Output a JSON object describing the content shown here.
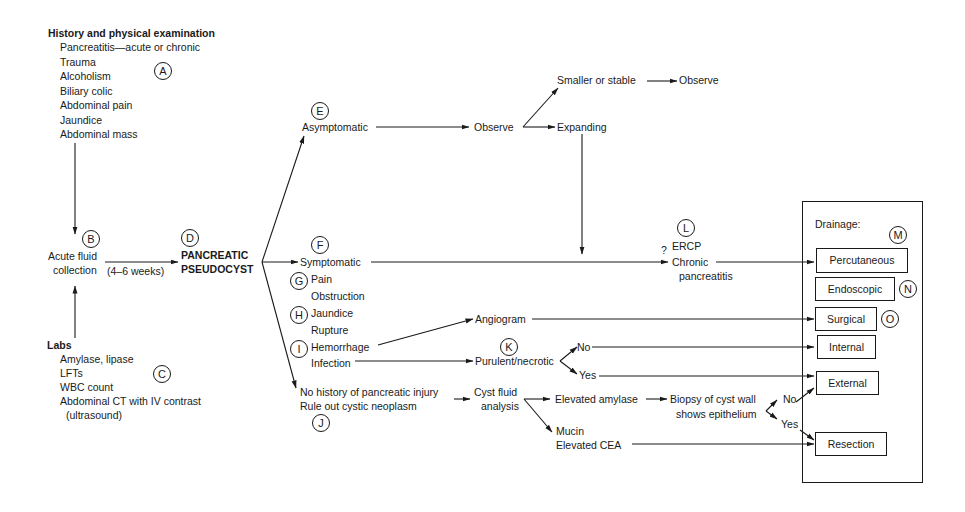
{
  "history": {
    "title": "History and physical examination",
    "items": [
      "Pancreatitis—acute or chronic",
      "Trauma",
      "Alcoholism",
      "Biliary colic",
      "Abdominal pain",
      "Jaundice",
      "Abdominal mass"
    ],
    "marker": "A"
  },
  "acute": {
    "line1": "Acute fluid",
    "line2": "collection",
    "marker": "B",
    "duration": "(4–6 weeks)"
  },
  "labs": {
    "title": "Labs",
    "items": [
      "Amylase, lipase",
      "LFTs",
      "WBC count",
      "Abdominal CT with IV contrast",
      "(ultrasound)"
    ],
    "marker": "C"
  },
  "pseudocyst": {
    "line1": "PANCREATIC",
    "line2": "PSEUDOCYST",
    "marker": "D"
  },
  "asymptomatic": {
    "label": "Asymptomatic",
    "marker": "E",
    "observe": "Observe",
    "smaller": "Smaller or stable",
    "observe2": "Observe",
    "expanding": "Expanding"
  },
  "symptomatic": {
    "label": "Symptomatic",
    "marker": "F",
    "items": [
      {
        "marker": "G",
        "label": "Pain"
      },
      {
        "marker": "",
        "label": "Obstruction"
      },
      {
        "marker": "H",
        "label": "Jaundice"
      },
      {
        "marker": "",
        "label": "Rupture"
      },
      {
        "marker": "I",
        "label": "Hemorrhage"
      },
      {
        "marker": "",
        "label": "Infection"
      }
    ]
  },
  "hemorrhage_path": {
    "angiogram": "Angiogram"
  },
  "infection_path": {
    "purulent": "Purulent/necrotic",
    "marker": "K",
    "no": "No",
    "yes": "Yes"
  },
  "ercp": {
    "question": "?",
    "line1": "ERCP",
    "line2": "Chronic",
    "line3": "pancreatitis",
    "marker": "L"
  },
  "neoplasm": {
    "line1": "No history of pancreatic injury",
    "line2": "Rule out cystic neoplasm",
    "marker": "J",
    "cyst1": "Cyst fluid",
    "cyst2": "analysis",
    "amylase": "Elevated amylase",
    "biopsy1": "Biopsy of cyst wall",
    "biopsy2": "shows epithelium",
    "no": "No",
    "yes": "Yes",
    "mucin1": "Mucin",
    "mucin2": "Elevated CEA"
  },
  "drainage": {
    "title": "Drainage:",
    "boxes": [
      {
        "label": "Percutaneous",
        "marker": "M"
      },
      {
        "label": "Endoscopic",
        "marker": "N"
      },
      {
        "label": "Surgical",
        "marker": "O"
      },
      {
        "label": "Internal",
        "marker": ""
      },
      {
        "label": "External",
        "marker": ""
      },
      {
        "label": "Resection",
        "marker": ""
      }
    ]
  }
}
